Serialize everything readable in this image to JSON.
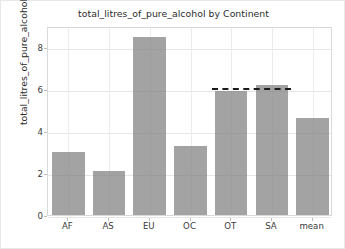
{
  "chart_data": {
    "type": "bar",
    "title": "total_litres_of_pure_alcohol by Continent",
    "xlabel": "",
    "ylabel": "total_litres_of_pure_alcohol",
    "categories": [
      "AF",
      "AS",
      "EU",
      "OC",
      "OT",
      "SA",
      "mean"
    ],
    "values": [
      3.0,
      2.1,
      8.5,
      3.3,
      5.9,
      6.2,
      4.6
    ],
    "ylim": [
      0,
      9.0
    ],
    "yticks": [
      0,
      2,
      4,
      6,
      8
    ],
    "ytick_labels": [
      "0",
      "2",
      "4",
      "6",
      "8"
    ],
    "grid": true,
    "legend": "none",
    "bar_color": "#808080",
    "annotations": [
      {
        "type": "reference-line",
        "style": "dashed",
        "color": "#1a1a1a",
        "value": 6.15,
        "x_start_category": "OT",
        "x_end_category": "SA"
      }
    ]
  }
}
